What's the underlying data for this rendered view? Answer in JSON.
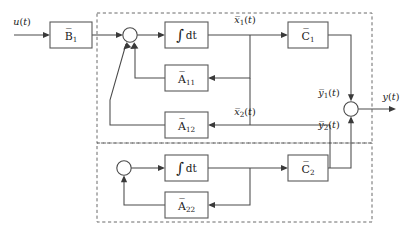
{
  "diagram": {
    "type": "control-block-diagram",
    "canvas": {
      "width": 408,
      "height": 233
    },
    "colors": {
      "background": "#ffffff",
      "block_stroke": "#5a5a5a",
      "wire_stroke": "#4a4a4a",
      "dashed_stroke": "#6a6a6a",
      "text": "#1a1a1a"
    },
    "signals": {
      "input": "u(t)",
      "output": "y(t)",
      "state_1": "x̅1(t)",
      "state_2": "x̅2(t)",
      "out_1": "y̅1(t)",
      "out_2": "y̅2(t)"
    },
    "blocks": [
      {
        "id": "B1",
        "label": "B̅1",
        "base": "B",
        "sub": "1",
        "kind": "gain",
        "x": 50,
        "y": 22,
        "w": 42,
        "h": 26
      },
      {
        "id": "INT1",
        "label": "∫ dt",
        "base": "∫",
        "sub": "",
        "kind": "integrator",
        "x": 165,
        "y": 22,
        "w": 43,
        "h": 26
      },
      {
        "id": "C1",
        "label": "C̅1",
        "base": "C",
        "sub": "1",
        "kind": "gain",
        "x": 288,
        "y": 22,
        "w": 40,
        "h": 26
      },
      {
        "id": "A11",
        "label": "A̅11",
        "base": "A",
        "sub": "11",
        "kind": "gain",
        "x": 165,
        "y": 65,
        "w": 43,
        "h": 26
      },
      {
        "id": "A12",
        "label": "A̅12",
        "base": "A",
        "sub": "12",
        "kind": "gain",
        "x": 165,
        "y": 112,
        "w": 43,
        "h": 26
      },
      {
        "id": "INT2",
        "label": "∫ dt",
        "base": "∫",
        "sub": "",
        "kind": "integrator",
        "x": 165,
        "y": 155,
        "w": 43,
        "h": 26
      },
      {
        "id": "C2",
        "label": "C̅2",
        "base": "C",
        "sub": "2",
        "kind": "gain",
        "x": 288,
        "y": 155,
        "w": 40,
        "h": 26
      },
      {
        "id": "A22",
        "label": "A̅22",
        "base": "A",
        "sub": "22",
        "kind": "gain",
        "x": 165,
        "y": 192,
        "w": 43,
        "h": 26
      }
    ],
    "junctions": [
      {
        "id": "SUM1",
        "cx": 130,
        "cy": 35,
        "r": 7.2
      },
      {
        "id": "SUM2",
        "cx": 124,
        "cy": 168,
        "r": 7.2
      },
      {
        "id": "SUMY",
        "cx": 351,
        "cy": 109,
        "r": 7.2
      }
    ],
    "subsystem_boxes": [
      {
        "id": "subsystem-1",
        "x": 97,
        "y": 13,
        "w": 275,
        "h": 130
      },
      {
        "id": "subsystem-2",
        "x": 97,
        "y": 143,
        "w": 275,
        "h": 79
      }
    ],
    "labels": [
      {
        "id": "u",
        "text": "u(t)",
        "x": 22,
        "y": 22
      },
      {
        "id": "x1",
        "text": "x̅1(t)",
        "x": 245,
        "y": 20
      },
      {
        "id": "x2",
        "text": "x̅2(t)",
        "x": 245,
        "y": 124
      },
      {
        "id": "y1",
        "text": "y̅1(t)",
        "x": 329,
        "y": 93
      },
      {
        "id": "y2",
        "text": "y̅2(t)",
        "x": 329,
        "y": 125
      },
      {
        "id": "y",
        "text": "y(t)",
        "x": 391,
        "y": 97
      }
    ]
  }
}
